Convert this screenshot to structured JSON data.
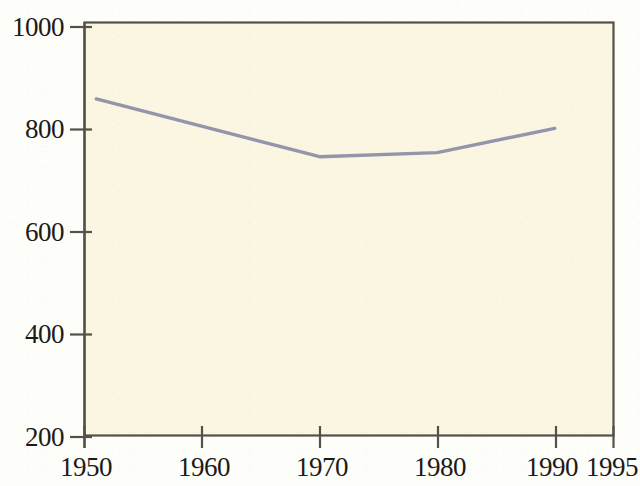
{
  "chart_data": {
    "type": "line",
    "title": "",
    "subtitle": "",
    "xlabel": "",
    "ylabel": "",
    "x": [
      1951,
      1970,
      1980,
      1990
    ],
    "series": [
      {
        "name": "series-1",
        "x": [
          1951,
          1970,
          1980,
          1990
        ],
        "values": [
          852,
          740,
          748,
          795
        ],
        "color": "#9395ab",
        "line_width": 3
      }
    ],
    "xlim": [
      1950,
      1995
    ],
    "ylim": [
      200,
      1000
    ],
    "xticks": [
      1950,
      1960,
      1970,
      1980,
      1990,
      1995
    ],
    "xtick_labels": [
      "1950",
      "1960",
      "1970",
      "1980",
      "1990",
      "1995"
    ],
    "yticks": [
      200,
      400,
      600,
      800,
      1000
    ],
    "ytick_labels": [
      "200",
      "400",
      "600",
      "800",
      "1000"
    ],
    "grid": false,
    "legend": null,
    "legend_position": "none",
    "annotations": []
  },
  "style": {
    "plot_background": "#faf6e2",
    "figure_background": "#fdfdfa",
    "axis_color": "#55504a",
    "tick_color": "#55504a",
    "tick_label_color": "#1c1a17",
    "line_color": "#9395ab"
  },
  "axes": {
    "x_tick_labels": [
      "1950",
      "1960",
      "1970",
      "1980",
      "1990",
      "1995"
    ],
    "y_tick_labels": [
      "200",
      "400",
      "600",
      "800",
      "1000"
    ]
  }
}
